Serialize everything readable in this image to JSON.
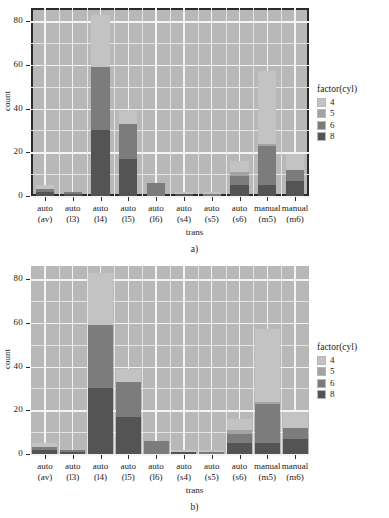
{
  "figure": {
    "panels": [
      {
        "id": "a",
        "caption": "a)",
        "panel_border": true,
        "bar_width_ratio": 0.66
      },
      {
        "id": "b",
        "caption": "b)",
        "panel_border": false,
        "bar_width_ratio": 0.9
      }
    ]
  },
  "legend": {
    "title": "factor(cyl)",
    "items": [
      {
        "label": "4",
        "color": "#c3c3c3"
      },
      {
        "label": "5",
        "color": "#a3a3a3"
      },
      {
        "label": "6",
        "color": "#7c7c7c"
      },
      {
        "label": "8",
        "color": "#545454"
      }
    ]
  },
  "colors": {
    "panel_background": "#b8b8b8",
    "grid_major": "#f4f4f4",
    "grid_minor": "#e4e4e4",
    "axis_text": "#1a1a1a",
    "panel_border": "#2b2b2b"
  },
  "chart_data": {
    "type": "bar",
    "stacked": true,
    "title": "",
    "subtitle": "",
    "xlabel": "trans",
    "ylabel": "count",
    "ylim": [
      0,
      86
    ],
    "yticks": [
      0,
      20,
      40,
      60,
      80
    ],
    "ytick_labels": [
      "0",
      "20",
      "40",
      "60",
      "80"
    ],
    "y_minor_ticks": [
      10,
      30,
      50,
      70
    ],
    "grid": true,
    "legend_position": "right",
    "legend_title": "factor(cyl)",
    "categories": [
      "auto\n(av)",
      "auto\n(l3)",
      "auto\n(l4)",
      "auto\n(l5)",
      "auto\n(l6)",
      "auto\n(s4)",
      "auto\n(s5)",
      "auto\n(s6)",
      "manual\n(m5)",
      "manual\n(m6)"
    ],
    "category_labels": [
      {
        "line1": "auto",
        "line2": "(av)"
      },
      {
        "line1": "auto",
        "line2": "(l3)"
      },
      {
        "line1": "auto",
        "line2": "(l4)"
      },
      {
        "line1": "auto",
        "line2": "(l5)"
      },
      {
        "line1": "auto",
        "line2": "(l6)"
      },
      {
        "line1": "auto",
        "line2": "(s4)"
      },
      {
        "line1": "auto",
        "line2": "(s5)"
      },
      {
        "line1": "auto",
        "line2": "(s6)"
      },
      {
        "line1": "manual",
        "line2": "(m5)"
      },
      {
        "line1": "manual",
        "line2": "(m6)"
      }
    ],
    "series": [
      {
        "name": "4",
        "color": "#c3c3c3",
        "values": [
          2,
          0,
          24,
          6,
          0,
          1,
          1,
          5,
          33,
          7
        ]
      },
      {
        "name": "5",
        "color": "#a3a3a3",
        "values": [
          0,
          0,
          0,
          0,
          0,
          0,
          0,
          2,
          1,
          0
        ]
      },
      {
        "name": "6",
        "color": "#7c7c7c",
        "values": [
          1,
          1,
          29,
          16,
          6,
          0,
          1,
          4,
          18,
          5
        ]
      },
      {
        "name": "8",
        "color": "#545454",
        "values": [
          2,
          1,
          30,
          17,
          0,
          1,
          0,
          5,
          5,
          7
        ]
      }
    ],
    "totals": [
      5,
      2,
      83,
      39,
      6,
      2,
      2,
      16,
      57,
      19
    ]
  }
}
